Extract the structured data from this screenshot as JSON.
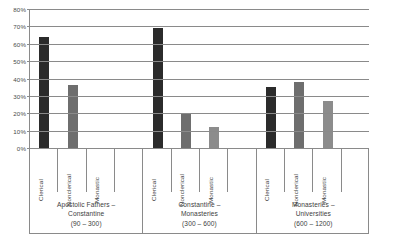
{
  "chart_data": {
    "type": "bar",
    "title": "",
    "xlabel": "",
    "ylabel": "",
    "ylim": [
      0,
      80
    ],
    "grid": true,
    "legend": "none",
    "categories": [
      "Clerical",
      "Nonclerical",
      "Monastic"
    ],
    "groups": [
      {
        "name": "Apostolic Fathers – Constantine",
        "lines": [
          "Apostolic Fathers –",
          "Constantine",
          "(90 – 300)"
        ],
        "period": "(90 – 300)",
        "values": [
          64,
          36,
          0
        ]
      },
      {
        "name": "Constantine – Monasteries",
        "lines": [
          "Constantine –",
          "Monasteries",
          "(300 – 600)"
        ],
        "period": "(300 – 600)",
        "values": [
          69,
          20,
          12
        ]
      },
      {
        "name": "Monasteries – Universities",
        "lines": [
          "Monasteries –",
          "Universities",
          "(600 – 1200)"
        ],
        "period": "(600 – 1200)",
        "values": [
          35,
          38,
          27
        ]
      }
    ],
    "series": [
      {
        "name": "Clerical",
        "values": [
          64,
          69,
          35
        ],
        "color": "#2b2b2b"
      },
      {
        "name": "Nonclerical",
        "values": [
          36,
          20,
          38
        ],
        "color": "#6e6e6e"
      },
      {
        "name": "Monastic",
        "values": [
          0,
          12,
          27
        ],
        "color": "#8c8c8c"
      }
    ],
    "yticks": [
      {
        "value": 80,
        "label": "80%"
      },
      {
        "value": 70,
        "label": "70%"
      },
      {
        "value": 60,
        "label": "60%"
      },
      {
        "value": 50,
        "label": "50%"
      },
      {
        "value": 40,
        "label": "40%"
      },
      {
        "value": 30,
        "label": "30%"
      },
      {
        "value": 20,
        "label": "20%"
      },
      {
        "value": 10,
        "label": "10%"
      },
      {
        "value": 0,
        "label": "0%"
      }
    ],
    "colors": {
      "clerical": "#2b2b2b",
      "nonclerical": "#6e6e6e",
      "monastic": "#8c8c8c",
      "axis": "#8a8a8a",
      "text": "#3d3d3d",
      "background": "#ffffff"
    }
  }
}
